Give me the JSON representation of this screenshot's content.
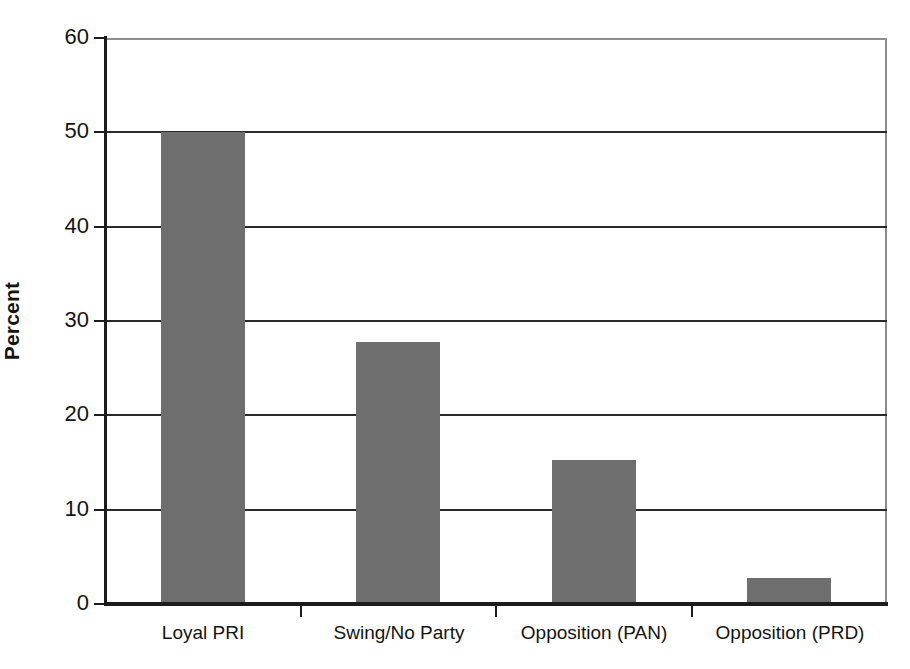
{
  "chart_data": {
    "type": "bar",
    "title": "",
    "subtitle": "",
    "xlabel": "",
    "ylabel": "Percent",
    "categories": [
      "Loyal PRI",
      "Swing/No Party",
      "Opposition (PAN)",
      "Opposition (PRD)"
    ],
    "values": [
      50.0,
      27.8,
      15.3,
      2.8
    ],
    "ylim": [
      0,
      60
    ],
    "ytick_labels": [
      "0",
      "10",
      "20",
      "30",
      "40",
      "50",
      "60"
    ],
    "ytick_values": [
      0,
      10,
      20,
      30,
      40,
      50,
      60
    ],
    "grid": "horizontal",
    "legend": "none",
    "bar_color": "#6e6e6e",
    "axis_color": "#1c1c1c",
    "gridline_color": "#2a2a2a",
    "frame_color": "#8d8d8d",
    "background_color": "#ffffff",
    "annotations": []
  }
}
